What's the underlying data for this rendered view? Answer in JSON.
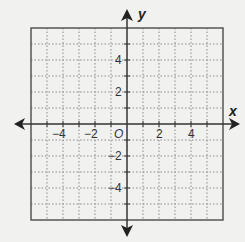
{
  "diagram": {
    "type": "coordinate-plane",
    "axes": {
      "x_label": "x",
      "y_label": "y",
      "origin_label": "O"
    },
    "range": {
      "xmin": -6,
      "xmax": 6,
      "ymin": -6,
      "ymax": 6
    },
    "grid": {
      "step": 1,
      "style": "dotted"
    },
    "x_tick_labels": [
      {
        "value": -4,
        "text": "−4"
      },
      {
        "value": -2,
        "text": "−2"
      },
      {
        "value": 2,
        "text": "2"
      },
      {
        "value": 4,
        "text": "4"
      }
    ],
    "y_tick_labels": [
      {
        "value": 4,
        "text": "4"
      },
      {
        "value": 2,
        "text": "2"
      },
      {
        "value": -2,
        "text": "−2"
      },
      {
        "value": -4,
        "text": "−4"
      }
    ],
    "colors": {
      "background": "#f1f1ef",
      "grid": "#8a8a8a",
      "axis": "#333333",
      "border": "#555555"
    }
  }
}
